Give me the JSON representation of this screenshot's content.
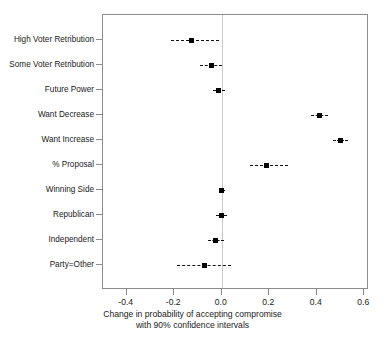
{
  "chart_data": {
    "type": "scatter",
    "title": "",
    "subtitle": "",
    "xlabel_line1": "Change in probability of accepting compromise",
    "xlabel_line2": "with 90% confidence intervals",
    "ylabel": "",
    "xlim": [
      -0.5,
      0.62
    ],
    "xticks": [
      -0.4,
      -0.2,
      0.0,
      0.2,
      0.4,
      0.6
    ],
    "xtick_labels": [
      "-0.4",
      "-0.2",
      "0.0",
      "0.2",
      "0.4",
      "0.6"
    ],
    "grid": false,
    "legend": "none",
    "zero_reference_line": 0.0,
    "categories": [
      "High Voter Retribution",
      "Some Voter Retribution",
      "Future Power",
      "Want Decrease",
      "Want Increase",
      "% Proposal",
      "Winning Side",
      "Republican",
      "Independent",
      "Party=Other"
    ],
    "values": [
      -0.126,
      -0.043,
      -0.012,
      0.41,
      0.5,
      0.188,
      0.001,
      -0.001,
      -0.026,
      -0.071
    ],
    "ci_low": [
      -0.212,
      -0.09,
      -0.036,
      0.377,
      0.47,
      0.12,
      -0.012,
      -0.024,
      -0.06,
      -0.19
    ],
    "ci_high": [
      -0.013,
      0.0,
      0.013,
      0.448,
      0.53,
      0.28,
      0.014,
      0.022,
      0.01,
      0.037
    ],
    "confidence_level": "90%",
    "points": [
      {
        "label": "High Voter Retribution",
        "value": -0.126,
        "ci_low": -0.212,
        "ci_high": -0.013
      },
      {
        "label": "Some Voter Retribution",
        "value": -0.043,
        "ci_low": -0.09,
        "ci_high": 0.0
      },
      {
        "label": "Future Power",
        "value": -0.012,
        "ci_low": -0.036,
        "ci_high": 0.013
      },
      {
        "label": "Want Decrease",
        "value": 0.41,
        "ci_low": 0.377,
        "ci_high": 0.448
      },
      {
        "label": "Want Increase",
        "value": 0.5,
        "ci_low": 0.47,
        "ci_high": 0.53
      },
      {
        "label": "% Proposal",
        "value": 0.188,
        "ci_low": 0.12,
        "ci_high": 0.28
      },
      {
        "label": "Winning Side",
        "value": 0.001,
        "ci_low": -0.012,
        "ci_high": 0.014
      },
      {
        "label": "Republican",
        "value": -0.001,
        "ci_low": -0.024,
        "ci_high": 0.022
      },
      {
        "label": "Independent",
        "value": -0.026,
        "ci_low": -0.06,
        "ci_high": 0.01
      },
      {
        "label": "Party=Other",
        "value": -0.071,
        "ci_low": -0.19,
        "ci_high": 0.037
      }
    ],
    "colors": {
      "point": "#000000",
      "interval": "#111111",
      "axis": "#8c8c8c",
      "zero_line": "#c9c9c9",
      "background": "#ffffff"
    }
  }
}
